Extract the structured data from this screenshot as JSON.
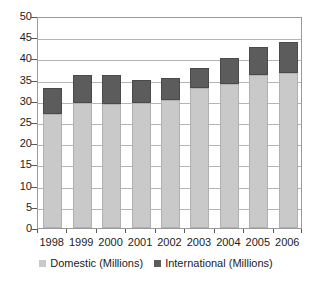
{
  "chart_data": {
    "type": "bar",
    "subtype": "stacked-column",
    "title": "",
    "subtitle": "",
    "xlabel": "",
    "ylabel": "",
    "categories": [
      "1998",
      "1999",
      "2000",
      "2001",
      "2002",
      "2003",
      "2004",
      "2005",
      "2006"
    ],
    "series": [
      {
        "name": "Domestic (Millions)",
        "color": "#c9c9c9",
        "values": [
          27.0,
          29.5,
          29.3,
          29.4,
          30.2,
          33.0,
          33.9,
          36.0,
          36.6
        ]
      },
      {
        "name": "International (Millions)",
        "color": "#5c5c5c",
        "values": [
          6.0,
          6.7,
          6.8,
          5.6,
          5.1,
          4.8,
          6.2,
          6.7,
          7.2
        ]
      }
    ],
    "totals": [
      33.0,
      36.2,
      36.1,
      35.0,
      35.3,
      37.8,
      40.1,
      42.7,
      43.8
    ],
    "ylim": [
      0,
      50
    ],
    "y_ticks": [
      0,
      5,
      10,
      15,
      20,
      25,
      30,
      35,
      40,
      45,
      50
    ],
    "y_tick_labels": [
      "0",
      "5",
      "10",
      "15",
      "20",
      "25",
      "30",
      "35",
      "40",
      "45",
      "50"
    ],
    "grid": true,
    "grid_axis": "y",
    "legend_position": "bottom",
    "legend": [
      "Domestic (Millions)",
      "International (Millions)"
    ]
  },
  "colors": {
    "domestic": "#c9c9c9",
    "international": "#5c5c5c",
    "gridline": "#b4b4b4",
    "axis": "#9a9a9a",
    "text": "#1c1c1c",
    "background": "#ffffff"
  }
}
